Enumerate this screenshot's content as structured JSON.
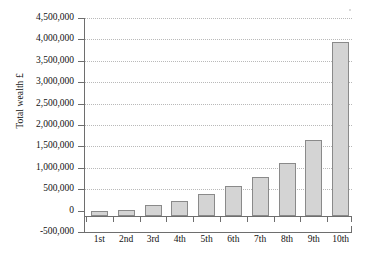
{
  "chart_data": {
    "type": "bar",
    "title": "",
    "xlabel": "",
    "ylabel": "Total wealth £",
    "categories": [
      "1st",
      "2nd",
      "3rd",
      "4th",
      "5th",
      "6th",
      "7th",
      "8th",
      "9th",
      "10th"
    ],
    "values": [
      0,
      20000,
      120000,
      230000,
      380000,
      570000,
      790000,
      1120000,
      1640000,
      3950000
    ],
    "ylim": [
      -500000,
      4500000
    ],
    "ytick_values": [
      -500000,
      0,
      500000,
      1000000,
      1500000,
      2000000,
      2500000,
      3000000,
      3500000,
      4000000,
      4500000
    ],
    "ytick_labels": [
      "-500,000",
      "0",
      "500,000",
      "1,000,000",
      "1,500,000",
      "2,000,000",
      "2,500,000",
      "3,000,000",
      "3,500,000",
      "4,000,000",
      "4,500,000"
    ],
    "grid": true,
    "legend": "none",
    "series": [
      {
        "name": "Total wealth",
        "values": [
          0,
          20000,
          120000,
          230000,
          380000,
          570000,
          790000,
          1120000,
          1640000,
          3950000
        ]
      }
    ],
    "colors": {
      "bar_fill": "#d4d4d4",
      "bar_border": "#8a8a8a",
      "axis": "#6e6e6e",
      "gridline": "#b9b9b9",
      "text": "#111111"
    }
  }
}
